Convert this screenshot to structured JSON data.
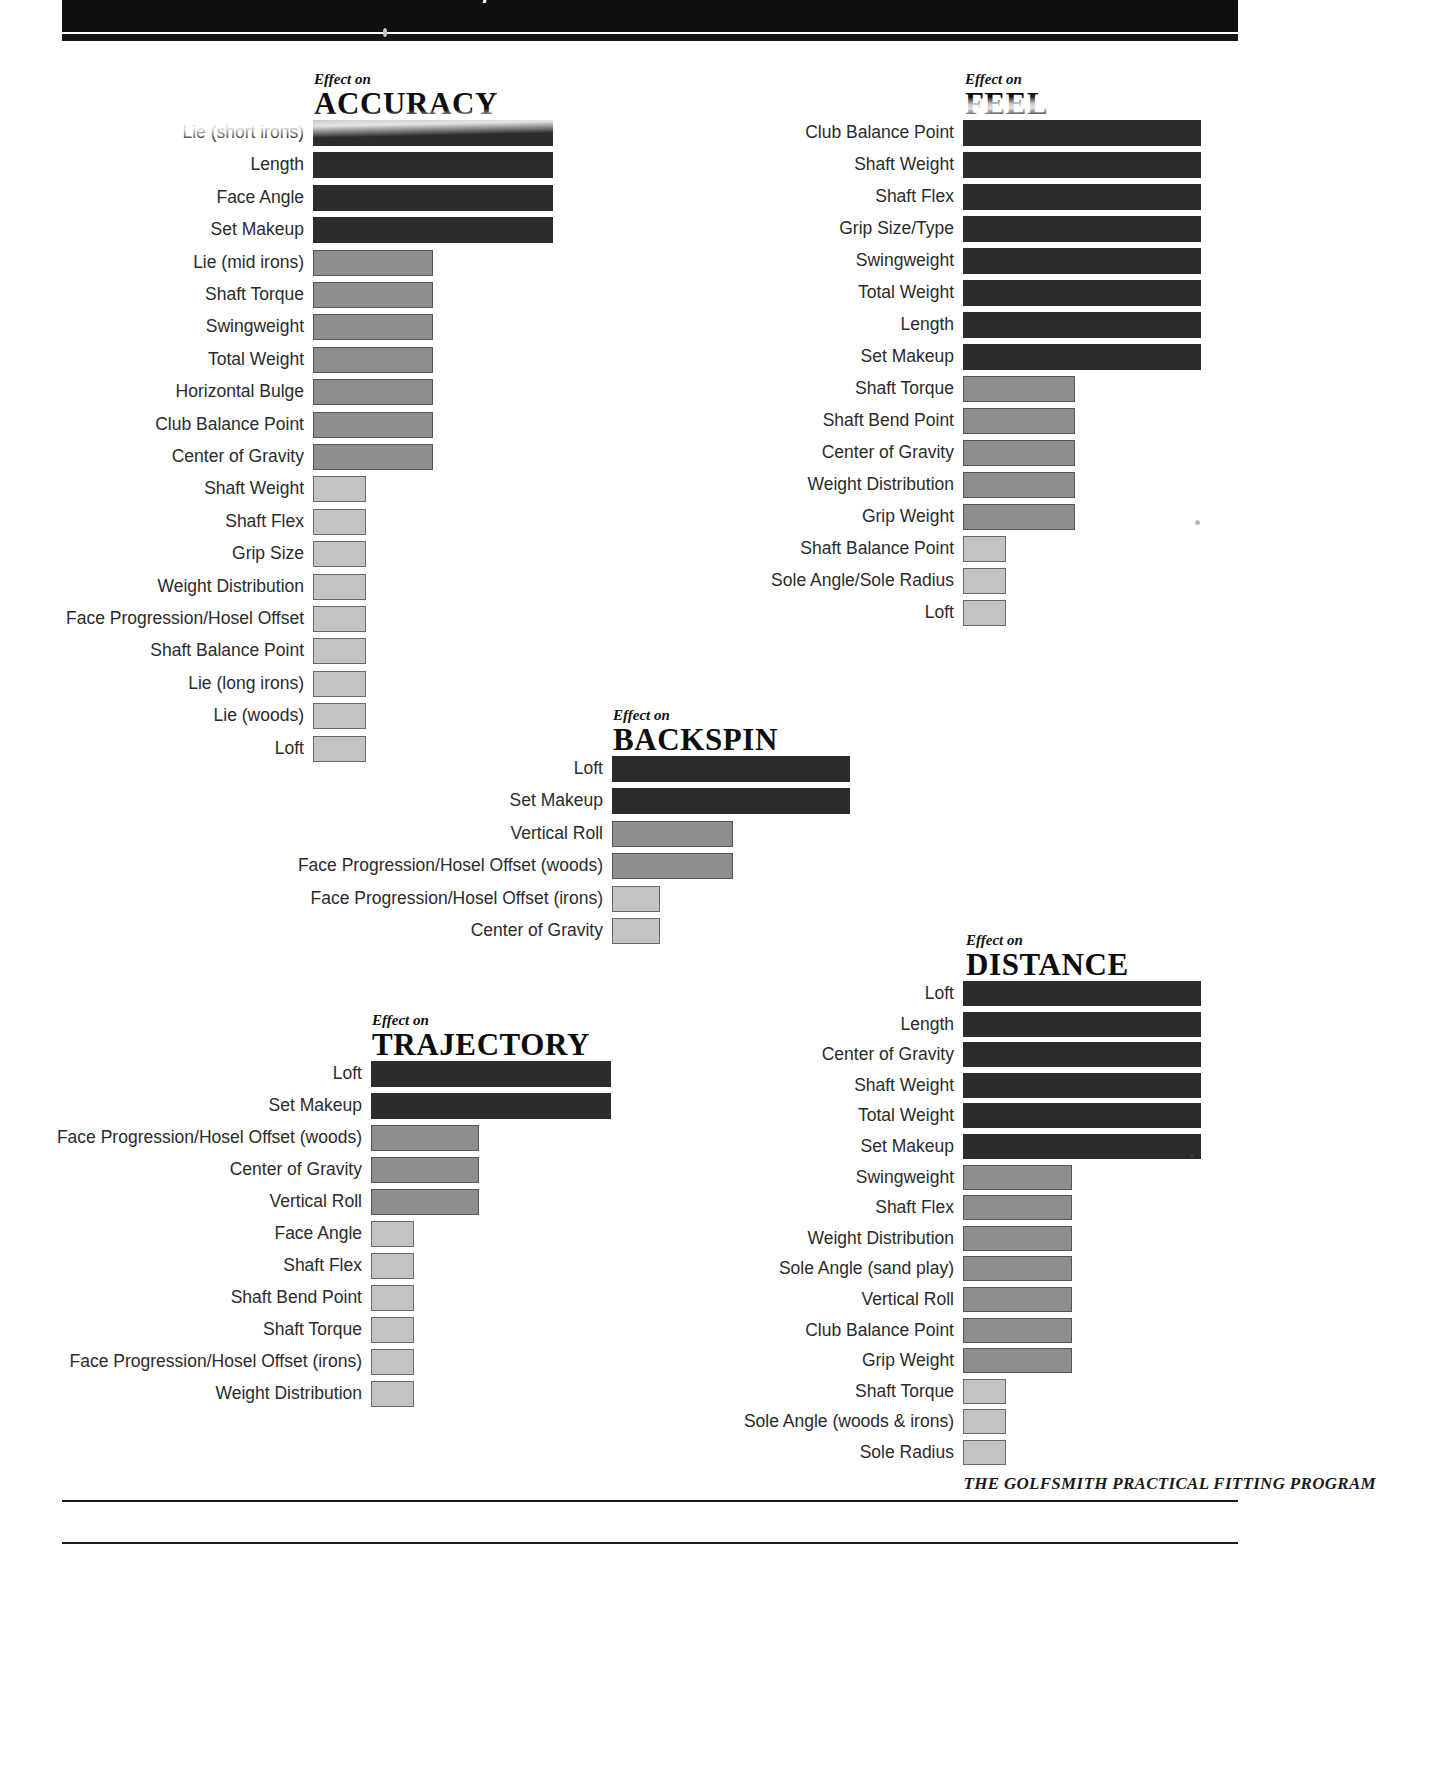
{
  "banner": {
    "title": "Effects of Golf Club Specifications on Shot Performance"
  },
  "footer": {
    "credit": "THE GOLFSMITH PRACTICAL FITTING PROGRAM"
  },
  "eyebrow": "Effect on",
  "chart_data": [
    {
      "type": "bar",
      "id": "accuracy",
      "title": "ACCURACY",
      "eyebrow": "Effect on",
      "orientation": "horizontal",
      "xlabel": "",
      "ylabel": "",
      "levels": [
        "high",
        "medium",
        "low"
      ],
      "categories": [
        "Lie (short irons)",
        "Length",
        "Face Angle",
        "Set Makeup",
        "Lie (mid irons)",
        "Shaft Torque",
        "Swingweight",
        "Total Weight",
        "Horizontal Bulge",
        "Club Balance Point",
        "Center of Gravity",
        "Shaft Weight",
        "Shaft Flex",
        "Grip Size",
        "Weight Distribution",
        "Face Progression/Hosel Offset",
        "Shaft Balance Point",
        "Lie (long irons)",
        "Lie (woods)",
        "Loft"
      ],
      "values": [
        100,
        100,
        100,
        100,
        50,
        50,
        50,
        50,
        50,
        50,
        50,
        22,
        22,
        22,
        22,
        22,
        22,
        22,
        22,
        22
      ],
      "levels_per_bar": [
        "high",
        "high",
        "high",
        "high",
        "med",
        "med",
        "med",
        "med",
        "med",
        "med",
        "med",
        "low",
        "low",
        "low",
        "low",
        "low",
        "low",
        "low",
        "low",
        "low"
      ]
    },
    {
      "type": "bar",
      "id": "feel",
      "title": "FEEL",
      "eyebrow": "Effect on",
      "orientation": "horizontal",
      "categories": [
        "Club Balance Point",
        "Shaft Weight",
        "Shaft Flex",
        "Grip Size/Type",
        "Swingweight",
        "Total Weight",
        "Length",
        "Set Makeup",
        "Shaft Torque",
        "Shaft Bend Point",
        "Center of Gravity",
        "Weight Distribution",
        "Grip Weight",
        "Shaft Balance Point",
        "Sole Angle/Sole Radius",
        "Loft"
      ],
      "values": [
        100,
        100,
        100,
        100,
        100,
        100,
        100,
        100,
        47,
        47,
        47,
        47,
        47,
        18,
        18,
        18
      ],
      "levels_per_bar": [
        "high",
        "high",
        "high",
        "high",
        "high",
        "high",
        "high",
        "high",
        "med",
        "med",
        "med",
        "med",
        "med",
        "low",
        "low",
        "low"
      ]
    },
    {
      "type": "bar",
      "id": "backspin",
      "title": "BACKSPIN",
      "eyebrow": "Effect on",
      "orientation": "horizontal",
      "categories": [
        "Loft",
        "Set Makeup",
        "Vertical Roll",
        "Face Progression/Hosel Offset (woods)",
        "Face Progression/Hosel Offset (irons)",
        "Center of Gravity"
      ],
      "values": [
        100,
        100,
        51,
        51,
        20,
        20
      ],
      "levels_per_bar": [
        "high",
        "high",
        "med",
        "med",
        "low",
        "low"
      ]
    },
    {
      "type": "bar",
      "id": "trajectory",
      "title": "TRAJECTORY",
      "eyebrow": "Effect on",
      "orientation": "horizontal",
      "categories": [
        "Loft",
        "Set Makeup",
        "Face Progression/Hosel Offset (woods)",
        "Center of Gravity",
        "Vertical Roll",
        "Face Angle",
        "Shaft Flex",
        "Shaft Bend Point",
        "Shaft Torque",
        "Face Progression/Hosel Offset (irons)",
        "Weight Distribution"
      ],
      "values": [
        100,
        100,
        45,
        45,
        45,
        18,
        18,
        18,
        18,
        18,
        18
      ],
      "levels_per_bar": [
        "high",
        "high",
        "med",
        "med",
        "med",
        "low",
        "low",
        "low",
        "low",
        "low",
        "low"
      ]
    },
    {
      "type": "bar",
      "id": "distance",
      "title": "DISTANCE",
      "eyebrow": "Effect on",
      "orientation": "horizontal",
      "categories": [
        "Loft",
        "Length",
        "Center of Gravity",
        "Shaft Weight",
        "Total Weight",
        "Set Makeup",
        "Swingweight",
        "Shaft Flex",
        "Weight Distribution",
        "Sole Angle (sand play)",
        "Vertical Roll",
        "Club Balance Point",
        "Grip Weight",
        "Shaft Torque",
        "Sole Angle (woods & irons)",
        "Sole Radius"
      ],
      "values": [
        100,
        100,
        100,
        100,
        100,
        100,
        46,
        46,
        46,
        46,
        46,
        46,
        46,
        18,
        18,
        18
      ],
      "levels_per_bar": [
        "high",
        "high",
        "high",
        "high",
        "high",
        "high",
        "med",
        "med",
        "med",
        "med",
        "med",
        "med",
        "med",
        "low",
        "low",
        "low"
      ]
    }
  ]
}
